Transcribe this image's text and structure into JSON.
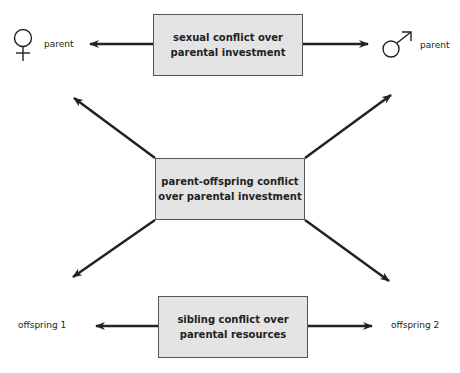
{
  "diagram": {
    "top_box": {
      "line1": "sexual conflict over",
      "line2": "parental investment"
    },
    "middle_box": {
      "line1": "parent-offspring conflict",
      "line2": "over parental investment"
    },
    "bottom_box": {
      "line1": "sibling conflict over",
      "line2": "parental resources"
    },
    "female_parent": {
      "symbol": "female-symbol",
      "label": "parent"
    },
    "male_parent": {
      "symbol": "male-symbol",
      "label": "parent"
    },
    "offspring_1": {
      "label": "offspring 1"
    },
    "offspring_2": {
      "label": "offspring 2"
    },
    "colors": {
      "box_fill": "#e4e4e4",
      "line": "#222222"
    }
  }
}
